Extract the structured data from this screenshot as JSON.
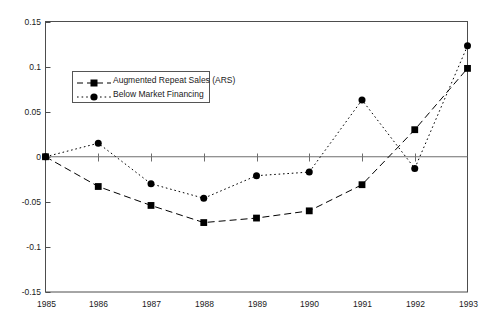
{
  "chart_data": {
    "type": "line",
    "title": "",
    "xlabel": "",
    "ylabel": "",
    "x": [
      1985,
      1986,
      1987,
      1988,
      1989,
      1990,
      1991,
      1992,
      1993
    ],
    "categories": [
      "1985",
      "1986",
      "1987",
      "1988",
      "1989",
      "1990",
      "1991",
      "1992",
      "1993"
    ],
    "xlim": [
      1985,
      1993
    ],
    "ylim": [
      -0.15,
      0.15
    ],
    "yticks": [
      0.15,
      0.1,
      0.05,
      0,
      -0.05,
      -0.1,
      -0.15
    ],
    "ytick_labels": [
      "0.15",
      "0.1",
      "0.05",
      "0",
      "-0.05",
      "-0.1",
      "-0.15"
    ],
    "xticks": [
      1985,
      1986,
      1987,
      1988,
      1989,
      1990,
      1991,
      1992,
      1993
    ],
    "xtick_labels": [
      "1985",
      "1986",
      "1987",
      "1988",
      "1989",
      "1990",
      "1991",
      "1992",
      "1993"
    ],
    "grid": false,
    "zero_line": true,
    "legend_position": "upper left inside",
    "series": [
      {
        "name": "Augmented Repeat Sales (ARS)",
        "linestyle": "dashed",
        "marker": "square",
        "color": "#000000",
        "values": [
          0.0,
          -0.033,
          -0.054,
          -0.073,
          -0.068,
          -0.06,
          -0.031,
          0.03,
          0.098
        ]
      },
      {
        "name": "Below Market Financing",
        "linestyle": "dotted",
        "marker": "circle",
        "color": "#000000",
        "values": [
          0.0,
          0.015,
          -0.03,
          -0.046,
          -0.021,
          -0.017,
          0.063,
          -0.013,
          0.123
        ]
      }
    ]
  },
  "legend": {
    "items": [
      {
        "label": "Augmented Repeat Sales (ARS)"
      },
      {
        "label": "Below Market Financing"
      }
    ]
  },
  "axes": {
    "frame_color": "#4d4d4d",
    "zero_line_color": "#6e6e6e",
    "text_color": "#1a1a1a"
  }
}
